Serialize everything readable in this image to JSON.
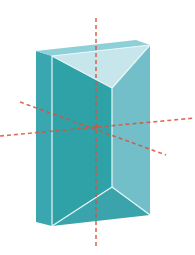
{
  "figure": {
    "title": "Triangular prism with dashed symmetry axes",
    "colors": {
      "background": "#ffffff",
      "left_face": "#3aa7b0",
      "front_face": "#2fa2a8",
      "right_face": "#73bfc9",
      "top_face": "#c6e6ec",
      "top_rim": "#8fd0d8",
      "bottom_face": "#3aa3ab",
      "edge_highlight": "#e8f7f8",
      "axis": "#d9533b"
    },
    "prism": {
      "top_back_left": [
        36,
        51
      ],
      "top_front_left": [
        52,
        56
      ],
      "top_back_right": [
        136,
        40
      ],
      "top_right": [
        150,
        45
      ],
      "top_apex": [
        112,
        88
      ],
      "bottom_apex": [
        112,
        187
      ],
      "bottom_back_left": [
        36,
        222
      ],
      "bottom_front_left": [
        52,
        226
      ],
      "bottom_right": [
        150,
        215
      ]
    },
    "axes": [
      {
        "name": "vertical-axis",
        "from": [
          96,
          18
        ],
        "to": [
          96,
          246
        ]
      },
      {
        "name": "horizontal-axis",
        "from": [
          0,
          136
        ],
        "to": [
          195,
          118
        ]
      },
      {
        "name": "diagonal-axis",
        "from": [
          20,
          102
        ],
        "to": [
          166,
          155
        ]
      }
    ]
  }
}
